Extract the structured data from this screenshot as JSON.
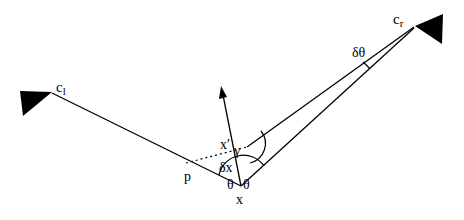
{
  "diagram": {
    "labels": {
      "camera_left": "c",
      "camera_left_sub": "l",
      "camera_right": "c",
      "camera_right_sub": "r",
      "point_x": "x",
      "point_x_prime": "x′",
      "point_p": "p",
      "delta_x": "δx",
      "delta_theta": "δθ",
      "gamma": "γ",
      "theta_left": "θ",
      "theta_right": "θ"
    },
    "colors": {
      "stroke": "#000000",
      "background": "#ffffff"
    }
  }
}
